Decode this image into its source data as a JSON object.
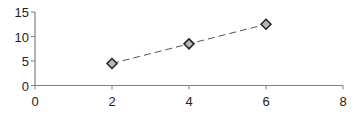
{
  "chart_data": {
    "type": "line",
    "title": "",
    "xlabel": "",
    "ylabel": "",
    "xlim": [
      0,
      8
    ],
    "ylim": [
      0,
      15
    ],
    "x_ticks": [
      0,
      2,
      4,
      6,
      8
    ],
    "y_ticks": [
      0,
      5,
      10,
      15
    ],
    "x_tick_labels": [
      "0",
      "2",
      "4",
      "6",
      "8"
    ],
    "y_tick_labels": [
      "0",
      "5",
      "10",
      "15"
    ],
    "grid": false,
    "legend": null,
    "series": [
      {
        "name": "Series 1",
        "line_style": "dashed",
        "marker": "diamond",
        "color": "#b8b8b8",
        "x": [
          2,
          4,
          6
        ],
        "y": [
          4.5,
          8.5,
          12.5
        ]
      }
    ]
  }
}
